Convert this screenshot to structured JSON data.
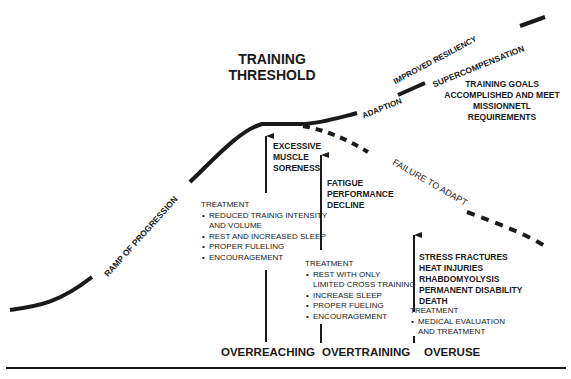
{
  "diagram": {
    "title_line1": "TRAINING",
    "title_line2": "THRESHOLD",
    "curve_labels": {
      "ramp": "RAMP OF PROGRESSION",
      "adaption": "ADAPTION",
      "improved": "IMPROVED RESILIENCY",
      "supercomp": "SUPERCOMPENSATION",
      "failure": "FAILURE TO ADAPT"
    },
    "goals": [
      "TRAINING GOALS",
      "ACCOMPLISHED AND MEET",
      "MISSIONNETL",
      "REQUIREMENTS"
    ],
    "stages": [
      {
        "name": "OVERREACHING",
        "symptoms": [
          "EXCESSIVE",
          "MUSCLE",
          "SORENESS"
        ],
        "treatment_header": "TREATMENT",
        "treatments": [
          "REDUCED TRAINIG INTENSITY",
          "AND VOLUME",
          "REST AND INCREASED SLEEP",
          "PROPER FULELING",
          "ENCOURAGEMENT"
        ]
      },
      {
        "name": "OVERTRAINING",
        "symptoms": [
          "FATIGUE",
          "PERFORMANCE",
          "DECLINE"
        ],
        "treatment_header": "TREATMENT",
        "treatments": [
          "REST WITH ONLY",
          "LIMITED CROSS TRAINING",
          "INCREASE SLEEP",
          "PROPER FUELING",
          "ENCOURAGEMENT"
        ]
      },
      {
        "name": "OVERUSE",
        "symptoms": [
          "STRESS FRACTURES",
          "HEAT INJURIES",
          "RHABDOMYOLYSIS",
          "PERMANENT DISABILITY",
          "DEATH"
        ],
        "treatment_header": "TREATMENT",
        "treatments": [
          "MEDICAL EVALUATION",
          "AND TREATMENT"
        ]
      }
    ],
    "colors": {
      "ink": "#1a1a1a",
      "background": "#ffffff"
    }
  }
}
